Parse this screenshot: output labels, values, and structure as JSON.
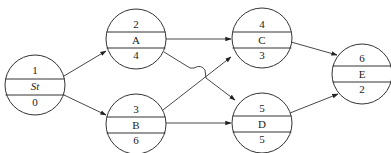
{
  "diagram": {
    "type": "activity-on-node network",
    "colors": {
      "stroke": "#333333",
      "text": "#222222",
      "background": "#ffffff"
    },
    "nodes": [
      {
        "id": "n1",
        "number": "1",
        "name": "St",
        "duration": "0",
        "italic": true,
        "cx": 35,
        "cy": 85,
        "r": 30
      },
      {
        "id": "n2",
        "number": "2",
        "name": "A",
        "duration": "4",
        "italic": false,
        "cx": 136,
        "cy": 39,
        "r": 30
      },
      {
        "id": "n3",
        "number": "3",
        "name": "B",
        "duration": "6",
        "italic": false,
        "cx": 136,
        "cy": 124,
        "r": 30
      },
      {
        "id": "n4",
        "number": "4",
        "name": "C",
        "duration": "3",
        "italic": false,
        "cx": 262,
        "cy": 38,
        "r": 30
      },
      {
        "id": "n5",
        "number": "5",
        "name": "D",
        "duration": "5",
        "italic": false,
        "cx": 262,
        "cy": 123,
        "r": 30
      },
      {
        "id": "n6",
        "number": "6",
        "name": "E",
        "duration": "2",
        "italic": false,
        "cx": 362,
        "cy": 74,
        "r": 30
      }
    ],
    "edges": [
      {
        "from": "St",
        "to": "A"
      },
      {
        "from": "St",
        "to": "B"
      },
      {
        "from": "A",
        "to": "C"
      },
      {
        "from": "A",
        "to": "D",
        "note": "crosses B→C with a jump-over hump"
      },
      {
        "from": "B",
        "to": "C"
      },
      {
        "from": "B",
        "to": "D"
      },
      {
        "from": "C",
        "to": "E"
      },
      {
        "from": "D",
        "to": "E"
      }
    ]
  }
}
